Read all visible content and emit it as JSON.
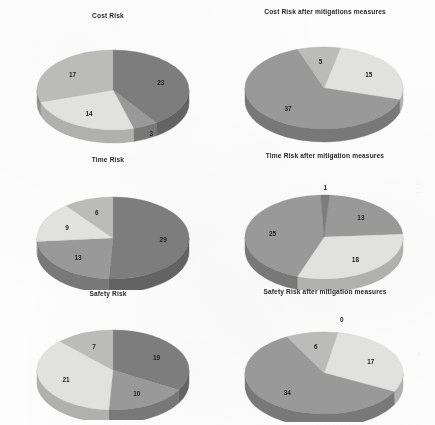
{
  "page": {
    "background": "#fdfdfd",
    "artifact_right_mid": "|| | |",
    "artifact_right_low": "y"
  },
  "palette": {
    "tone_dark": "#7d7d7d",
    "tone_mid": "#9a9a9a",
    "tone_light": "#e4e4e2",
    "tone_lightmid": "#bdbdbb",
    "side_dark": "#5f5f5f",
    "side_mid": "#787878",
    "side_light": "#b9b9b7",
    "side_lightmid": "#949492",
    "label_color": "#1f1f1f",
    "title_color": "#2a2a2a"
  },
  "chart_data": [
    {
      "id": "cost-risk",
      "type": "pie",
      "title": "Cost Risk",
      "labels": [
        "23",
        "3",
        "14",
        "17"
      ],
      "values": [
        23,
        3,
        14,
        17
      ],
      "total": 57,
      "start_angle": 0,
      "tones": [
        "tone_dark",
        "tone_mid",
        "tone_light",
        "tone_lightmid"
      ],
      "legend": "none",
      "grid": false
    },
    {
      "id": "cost-risk-after",
      "type": "pie",
      "title": "Cost Risk after mitigations measures",
      "labels": [
        "15",
        "37",
        "5"
      ],
      "values": [
        15,
        37,
        5
      ],
      "total": 57,
      "start_angle": 12,
      "tones": [
        "tone_light",
        "tone_mid",
        "tone_lightmid"
      ],
      "legend": "none",
      "grid": false
    },
    {
      "id": "time-risk",
      "type": "pie",
      "title": "Time Risk",
      "labels": [
        "29",
        "13",
        "9",
        "6"
      ],
      "values": [
        29,
        13,
        9,
        6
      ],
      "total": 57,
      "start_angle": 0,
      "tones": [
        "tone_dark",
        "tone_mid",
        "tone_light",
        "tone_lightmid"
      ],
      "legend": "none",
      "grid": false
    },
    {
      "id": "time-risk-after",
      "type": "pie",
      "title": "Time Risk after mitigation measures",
      "labels": [
        "13",
        "18",
        "25",
        "1"
      ],
      "values": [
        13,
        18,
        25,
        1
      ],
      "total": 57,
      "start_angle": 4,
      "tones": [
        "tone_mid",
        "tone_light",
        "tone_mid",
        "tone_dark"
      ],
      "legend": "none",
      "grid": false
    },
    {
      "id": "safety-risk",
      "type": "pie",
      "title": "Safety Risk",
      "labels": [
        "19",
        "10",
        "21",
        "7"
      ],
      "values": [
        19,
        10,
        21,
        7
      ],
      "total": 57,
      "start_angle": 0,
      "tones": [
        "tone_dark",
        "tone_mid",
        "tone_light",
        "tone_lightmid"
      ],
      "legend": "none",
      "grid": false
    },
    {
      "id": "safety-risk-after",
      "type": "pie",
      "title": "Safety Risk after mitigation measures",
      "labels": [
        "17",
        "34",
        "6",
        "0"
      ],
      "values": [
        17,
        34,
        6,
        0
      ],
      "total": 57,
      "start_angle": 10,
      "tones": [
        "tone_light",
        "tone_mid",
        "tone_lightmid",
        "tone_dark"
      ],
      "legend": "none",
      "grid": false
    }
  ],
  "layout": {
    "cells": [
      {
        "chart": 0,
        "x": 8,
        "y": 12,
        "w": 200,
        "h": 132,
        "pie_cx": 105,
        "pie_cy": 78,
        "rx": 76,
        "ry": 40,
        "depth": 13
      },
      {
        "chart": 1,
        "x": 222,
        "y": 8,
        "w": 206,
        "h": 136,
        "pie_cx": 102,
        "pie_cy": 80,
        "rx": 79,
        "ry": 41,
        "depth": 13
      },
      {
        "chart": 2,
        "x": 8,
        "y": 156,
        "w": 200,
        "h": 134,
        "pie_cx": 105,
        "pie_cy": 82,
        "rx": 76,
        "ry": 41,
        "depth": 14
      },
      {
        "chart": 3,
        "x": 222,
        "y": 152,
        "w": 206,
        "h": 138,
        "pie_cx": 102,
        "pie_cy": 85,
        "rx": 79,
        "ry": 42,
        "depth": 13
      },
      {
        "chart": 4,
        "x": 8,
        "y": 290,
        "w": 200,
        "h": 130,
        "pie_cx": 105,
        "pie_cy": 80,
        "rx": 76,
        "ry": 40,
        "depth": 13
      },
      {
        "chart": 5,
        "x": 222,
        "y": 288,
        "w": 206,
        "h": 134,
        "pie_cx": 102,
        "pie_cy": 85,
        "rx": 79,
        "ry": 41,
        "depth": 13
      }
    ]
  }
}
